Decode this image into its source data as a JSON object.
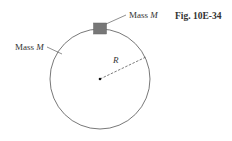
{
  "figure": {
    "caption": "Fig. 10E-34",
    "labels": {
      "top_mass_word": "Mass",
      "top_mass_symbol": "M",
      "ring_mass_word": "Mass",
      "ring_mass_symbol": "M",
      "radius": "R"
    },
    "colors": {
      "ring": "#555555",
      "block": "#777777",
      "text": "#333333"
    }
  }
}
